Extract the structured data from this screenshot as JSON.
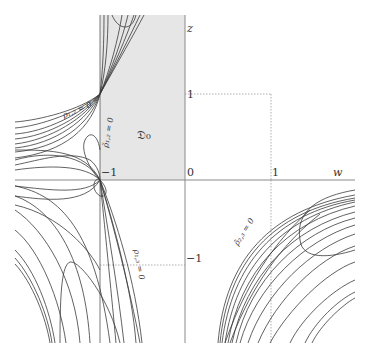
{
  "diagram": {
    "axes": {
      "horizontal_label": "w",
      "vertical_label": "z",
      "origin_label": "0",
      "ticks": {
        "w_one": "1",
        "w_minus_one": "−1",
        "z_one": "1",
        "z_minus_one": "−1"
      }
    },
    "region": {
      "label": "𝔇₀",
      "fill": "#e6e6e6",
      "bounds": {
        "w_min": -1,
        "w_max": 0,
        "z_min": 0,
        "z_max": "top"
      }
    },
    "curve_labels": {
      "rho12": "ρ₁,₂ = 0",
      "rho12_tilde": "ρ̃₁,₂ = 0",
      "rho13": "ρ₁,₃ = 0",
      "rho23_tilde": "ρ̃₂,₃ = 0"
    },
    "colors": {
      "curve": "#3a3a3a",
      "axis": "#8a8a8a",
      "dotted": "#9a9a9a",
      "shade": "#e6e6e6"
    }
  }
}
